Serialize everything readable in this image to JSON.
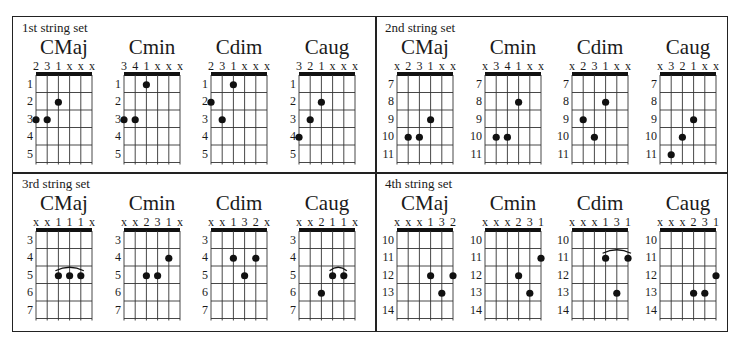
{
  "panels": [
    {
      "title": "1st string set",
      "frets": [
        "1",
        "2",
        "3",
        "4",
        "5"
      ],
      "chords": [
        {
          "name": "CMaj",
          "fingering": [
            "2",
            "3",
            "1",
            "x",
            "x",
            "x"
          ],
          "dots": [
            {
              "s": 0,
              "f": 3
            },
            {
              "s": 1,
              "f": 3
            },
            {
              "s": 2,
              "f": 2
            }
          ],
          "barre": null
        },
        {
          "name": "Cmin",
          "fingering": [
            "3",
            "4",
            "1",
            "x",
            "x",
            "x"
          ],
          "dots": [
            {
              "s": 0,
              "f": 3
            },
            {
              "s": 1,
              "f": 3
            },
            {
              "s": 2,
              "f": 1
            }
          ],
          "barre": null
        },
        {
          "name": "Cdim",
          "fingering": [
            "2",
            "3",
            "1",
            "x",
            "x",
            "x"
          ],
          "dots": [
            {
              "s": 0,
              "f": 2
            },
            {
              "s": 1,
              "f": 3
            },
            {
              "s": 2,
              "f": 1
            }
          ],
          "barre": null
        },
        {
          "name": "Caug",
          "fingering": [
            "3",
            "2",
            "1",
            "x",
            "x",
            "x"
          ],
          "dots": [
            {
              "s": 0,
              "f": 4
            },
            {
              "s": 1,
              "f": 3
            },
            {
              "s": 2,
              "f": 2
            }
          ],
          "barre": null
        }
      ]
    },
    {
      "title": "2nd string set",
      "frets": [
        "7",
        "8",
        "9",
        "10",
        "11"
      ],
      "chords": [
        {
          "name": "CMaj",
          "fingering": [
            "x",
            "2",
            "3",
            "1",
            "x",
            "x"
          ],
          "dots": [
            {
              "s": 1,
              "f": 4
            },
            {
              "s": 2,
              "f": 4
            },
            {
              "s": 3,
              "f": 3
            }
          ],
          "barre": null
        },
        {
          "name": "Cmin",
          "fingering": [
            "x",
            "3",
            "4",
            "1",
            "x",
            "x"
          ],
          "dots": [
            {
              "s": 1,
              "f": 4
            },
            {
              "s": 2,
              "f": 4
            },
            {
              "s": 3,
              "f": 2
            }
          ],
          "barre": null
        },
        {
          "name": "Cdim",
          "fingering": [
            "x",
            "2",
            "3",
            "1",
            "x",
            "x"
          ],
          "dots": [
            {
              "s": 1,
              "f": 3
            },
            {
              "s": 2,
              "f": 4
            },
            {
              "s": 3,
              "f": 2
            }
          ],
          "barre": null
        },
        {
          "name": "Caug",
          "fingering": [
            "x",
            "3",
            "2",
            "1",
            "x",
            "x"
          ],
          "dots": [
            {
              "s": 1,
              "f": 5
            },
            {
              "s": 2,
              "f": 4
            },
            {
              "s": 3,
              "f": 3
            }
          ],
          "barre": null
        }
      ]
    },
    {
      "title": "3rd string set",
      "frets": [
        "3",
        "4",
        "5",
        "6",
        "7"
      ],
      "chords": [
        {
          "name": "CMaj",
          "fingering": [
            "x",
            "x",
            "1",
            "1",
            "1",
            "x"
          ],
          "dots": [
            {
              "s": 2,
              "f": 3
            },
            {
              "s": 3,
              "f": 3
            },
            {
              "s": 4,
              "f": 3
            }
          ],
          "barre": {
            "from": 2,
            "to": 4,
            "f": 3
          }
        },
        {
          "name": "Cmin",
          "fingering": [
            "x",
            "x",
            "2",
            "3",
            "1",
            "x"
          ],
          "dots": [
            {
              "s": 2,
              "f": 3
            },
            {
              "s": 3,
              "f": 3
            },
            {
              "s": 4,
              "f": 2
            }
          ],
          "barre": null
        },
        {
          "name": "Cdim",
          "fingering": [
            "x",
            "x",
            "1",
            "3",
            "2",
            "x"
          ],
          "dots": [
            {
              "s": 2,
              "f": 2
            },
            {
              "s": 3,
              "f": 3
            },
            {
              "s": 4,
              "f": 2
            }
          ],
          "barre": null
        },
        {
          "name": "Caug",
          "fingering": [
            "x",
            "x",
            "2",
            "1",
            "1",
            "x"
          ],
          "dots": [
            {
              "s": 2,
              "f": 4
            },
            {
              "s": 3,
              "f": 3
            },
            {
              "s": 4,
              "f": 3
            }
          ],
          "barre": {
            "from": 3,
            "to": 4,
            "f": 3
          }
        }
      ]
    },
    {
      "title": "4th string set",
      "frets": [
        "10",
        "11",
        "12",
        "13",
        "14"
      ],
      "chords": [
        {
          "name": "CMaj",
          "fingering": [
            "x",
            "x",
            "x",
            "1",
            "3",
            "2"
          ],
          "dots": [
            {
              "s": 3,
              "f": 3
            },
            {
              "s": 4,
              "f": 4
            },
            {
              "s": 5,
              "f": 3
            }
          ],
          "barre": null
        },
        {
          "name": "Cmin",
          "fingering": [
            "x",
            "x",
            "x",
            "2",
            "3",
            "1"
          ],
          "dots": [
            {
              "s": 3,
              "f": 3
            },
            {
              "s": 4,
              "f": 4
            },
            {
              "s": 5,
              "f": 2
            }
          ],
          "barre": null
        },
        {
          "name": "Cdim",
          "fingering": [
            "x",
            "x",
            "x",
            "1",
            "3",
            "1"
          ],
          "dots": [
            {
              "s": 3,
              "f": 2
            },
            {
              "s": 4,
              "f": 4
            },
            {
              "s": 5,
              "f": 2
            }
          ],
          "barre": {
            "from": 3,
            "to": 5,
            "f": 2
          }
        },
        {
          "name": "Caug",
          "fingering": [
            "x",
            "x",
            "x",
            "2",
            "3",
            "1"
          ],
          "dots": [
            {
              "s": 3,
              "f": 4
            },
            {
              "s": 4,
              "f": 4
            },
            {
              "s": 5,
              "f": 3
            }
          ],
          "barre": null
        }
      ]
    }
  ]
}
